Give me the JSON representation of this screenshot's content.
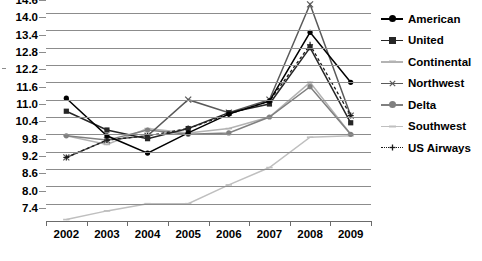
{
  "chart_data": {
    "type": "line",
    "title": "",
    "xlabel": "",
    "ylabel": "",
    "categories": [
      "2002",
      "2003",
      "2004",
      "2005",
      "2006",
      "2007",
      "2008",
      "2009"
    ],
    "ylim": [
      7.4,
      14.6
    ],
    "ytick_step": 0.6,
    "ytick_labels": [
      "14.6",
      "14.0",
      "13.4",
      "12.8",
      "12.2",
      "11.6",
      "11.0",
      "10.4",
      "9.8",
      "9.2",
      "8.6",
      "8.0",
      "7.4"
    ],
    "grid": true,
    "legend_position": "right",
    "series": [
      {
        "name": "American",
        "color": "#000000",
        "marker": "circle",
        "dash": false,
        "values": [
          11.65,
          10.35,
          9.75,
          10.45,
          11.1,
          11.55,
          13.93,
          12.2
        ]
      },
      {
        "name": "United",
        "color": "#262626",
        "marker": "square",
        "dash": false,
        "values": [
          11.2,
          10.55,
          10.25,
          10.6,
          11.15,
          11.45,
          13.4,
          10.8
        ]
      },
      {
        "name": "Continental",
        "color": "#b3b3b3",
        "marker": "dash",
        "dash": false,
        "values": [
          10.35,
          10.05,
          10.6,
          10.45,
          10.6,
          11.0,
          12.2,
          10.4
        ]
      },
      {
        "name": "Northwest",
        "color": "#595959",
        "marker": "x",
        "dash": false,
        "values": [
          9.6,
          10.2,
          10.35,
          11.6,
          11.15,
          11.6,
          14.9,
          11.05
        ]
      },
      {
        "name": "Delta",
        "color": "#808080",
        "marker": "circle",
        "dash": false,
        "values": [
          10.35,
          10.2,
          10.55,
          10.4,
          10.45,
          11.0,
          12.05,
          10.4
        ]
      },
      {
        "name": "Southwest",
        "color": "#bfbfbf",
        "marker": "dash",
        "dash": false,
        "values": [
          7.45,
          7.75,
          8.0,
          8.0,
          8.65,
          9.25,
          10.3,
          10.35
        ]
      },
      {
        "name": "US Airways",
        "color": "#1a1a1a",
        "marker": "plus",
        "dash": true,
        "values": [
          9.6,
          10.2,
          10.35,
          10.6,
          11.1,
          11.55,
          13.5,
          11.05
        ]
      }
    ]
  },
  "axes": {
    "y_ticks": [
      {
        "label": "14.6"
      },
      {
        "label": "14.0"
      },
      {
        "label": "13.4"
      },
      {
        "label": "12.8"
      },
      {
        "label": "12.2"
      },
      {
        "label": "11.6"
      },
      {
        "label": "11.0"
      },
      {
        "label": "10.4"
      },
      {
        "label": "9.8"
      },
      {
        "label": "9.2"
      },
      {
        "label": "8.6"
      },
      {
        "label": "8.0"
      },
      {
        "label": "7.4"
      }
    ],
    "x_ticks": [
      {
        "label": "2002"
      },
      {
        "label": "2003"
      },
      {
        "label": "2004"
      },
      {
        "label": "2005"
      },
      {
        "label": "2006"
      },
      {
        "label": "2007"
      },
      {
        "label": "2008"
      },
      {
        "label": "2009"
      }
    ]
  },
  "legend": {
    "items": [
      {
        "label": "American"
      },
      {
        "label": "United"
      },
      {
        "label": "Continental"
      },
      {
        "label": "Northwest"
      },
      {
        "label": "Delta"
      },
      {
        "label": "Southwest"
      },
      {
        "label": "US Airways"
      }
    ]
  }
}
